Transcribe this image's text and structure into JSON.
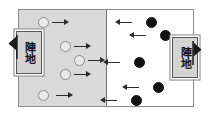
{
  "diagram": {
    "colors": {
      "left_territory": "#d9d9d9",
      "right_territory": "#ffffff",
      "frame": "#8a8a8a",
      "divider": "#6f6f6f",
      "open_token": "#e9e9e9",
      "open_token_border": "#8d8d8d",
      "filled_token": "#111111",
      "arrow": "#2b2b2b",
      "camp_fill": "#d4d4d4",
      "camp_border": "#555555",
      "flag": "#1a1a1a"
    },
    "camps": [
      {
        "id": "camp-left",
        "label": "陣地",
        "side": "left",
        "flag_direction": "left"
      },
      {
        "id": "camp-right",
        "label": "陣地",
        "side": "right",
        "flag_direction": "right"
      }
    ],
    "units": {
      "left_side": {
        "token_style": "open",
        "arrow_direction": "right",
        "count": 4,
        "items": [
          {
            "id": "left-unit-1",
            "x": 38,
            "y": 17
          },
          {
            "id": "left-unit-2",
            "x": 60,
            "y": 41
          },
          {
            "id": "left-unit-3",
            "x": 74,
            "y": 55
          },
          {
            "id": "left-unit-4",
            "x": 60,
            "y": 69
          },
          {
            "id": "left-unit-5",
            "x": 38,
            "y": 90
          }
        ]
      },
      "right_side": {
        "token_style": "filled",
        "arrow_direction": "left",
        "count": 5,
        "items": [
          {
            "id": "right-unit-1",
            "x": 146,
            "y": 17
          },
          {
            "id": "right-unit-2",
            "x": 160,
            "y": 30
          },
          {
            "id": "right-unit-3",
            "x": 134,
            "y": 57
          },
          {
            "id": "right-unit-4",
            "x": 153,
            "y": 82
          },
          {
            "id": "right-unit-5",
            "x": 131,
            "y": 95
          }
        ]
      }
    }
  }
}
